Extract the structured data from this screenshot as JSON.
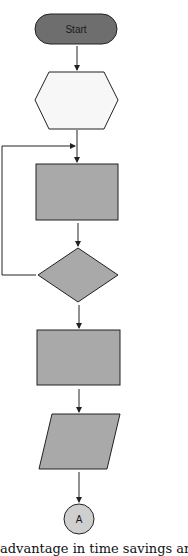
{
  "diagram": {
    "type": "flowchart",
    "colors": {
      "terminator_fill": "#6e6e6e",
      "process_fill": "#a9a9a9",
      "preparation_fill": "#f7f7f7",
      "connector_fill": "#cfcfcf",
      "stroke": "#222222"
    },
    "nodes": [
      {
        "id": "start",
        "shape": "terminator",
        "label": "Start"
      },
      {
        "id": "prep",
        "shape": "hexagon",
        "label": ""
      },
      {
        "id": "process1",
        "shape": "rectangle",
        "label": ""
      },
      {
        "id": "decision",
        "shape": "diamond",
        "label": ""
      },
      {
        "id": "process2",
        "shape": "rectangle",
        "label": ""
      },
      {
        "id": "io",
        "shape": "parallelogram",
        "label": ""
      },
      {
        "id": "connector",
        "shape": "circle",
        "label": "A"
      }
    ],
    "edges": [
      {
        "from": "start",
        "to": "prep"
      },
      {
        "from": "prep",
        "to": "process1"
      },
      {
        "from": "process1",
        "to": "decision"
      },
      {
        "from": "decision",
        "to": "process1",
        "note": "loop back via left side"
      },
      {
        "from": "decision",
        "to": "process2"
      },
      {
        "from": "process2",
        "to": "io"
      },
      {
        "from": "io",
        "to": "connector"
      }
    ]
  },
  "caption": "advantage in time savings and cos"
}
